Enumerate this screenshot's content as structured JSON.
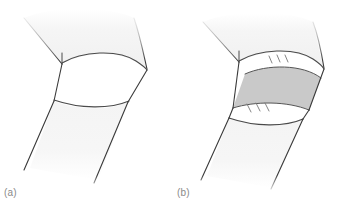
{
  "figure": {
    "name": "bent-joint-line-drawing",
    "width": 345,
    "height": 203,
    "background_color": "#ffffff",
    "panels": [
      {
        "id": "a",
        "caption": "(a)",
        "description": "Bent limb joint without wrap",
        "parts": [
          {
            "name": "upper-limb-segment",
            "fill": "#f2f2f2"
          },
          {
            "name": "joint-segment",
            "fill": "#ffffff"
          },
          {
            "name": "lower-limb-segment",
            "fill": "#f4f4f4"
          }
        ]
      },
      {
        "id": "b",
        "caption": "(b)",
        "description": "Bent limb joint with gray wrap band and stitch marks",
        "parts": [
          {
            "name": "upper-limb-segment",
            "fill": "#f2f2f2"
          },
          {
            "name": "upper-white-strip",
            "fill": "#ffffff"
          },
          {
            "name": "gray-wrap-band",
            "fill": "#c9c9c9"
          },
          {
            "name": "lower-white-strip",
            "fill": "#ffffff"
          },
          {
            "name": "lower-limb-segment",
            "fill": "#f4f4f4"
          },
          {
            "name": "upper-stitch-marks",
            "count": 3
          },
          {
            "name": "lower-stitch-marks",
            "count": 3
          }
        ]
      }
    ],
    "colors": {
      "outline": "#3a3a3a",
      "limb_fill_light": "#f2f2f2",
      "limb_fill_lower": "#f4f4f4",
      "joint_fill": "#ffffff",
      "band_fill": "#c9c9c9",
      "band_outline": "#555555",
      "caption_text": "#8a8a8a",
      "background": "#ffffff"
    }
  }
}
